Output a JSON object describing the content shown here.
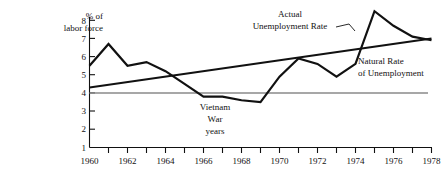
{
  "chart_data": {
    "type": "line",
    "title": "",
    "xlabel": "",
    "ylabel": "% of labor force",
    "ylabel_line1": "% of",
    "ylabel_line2": "labor force",
    "xlim": [
      1960,
      1978
    ],
    "ylim": [
      1,
      8
    ],
    "ytick_labels": [
      "1",
      "2",
      "3",
      "4",
      "5",
      "6",
      "7",
      "8"
    ],
    "ytick_values": [
      1,
      2,
      3,
      4,
      5,
      6,
      7,
      8
    ],
    "xtick_values": [
      1960,
      1961,
      1962,
      1963,
      1964,
      1965,
      1966,
      1967,
      1968,
      1969,
      1970,
      1971,
      1972,
      1973,
      1974,
      1975,
      1976,
      1977,
      1978
    ],
    "xtick_labels_shown": [
      "1960",
      "1962",
      "1964",
      "1966",
      "1968",
      "1970",
      "1972",
      "1974",
      "1976",
      "1978"
    ],
    "grid": false,
    "legend_position": "inline-annotations",
    "series": [
      {
        "name": "Actual Unemployment Rate",
        "color": "#111111",
        "x": [
          1960,
          1961,
          1962,
          1963,
          1964,
          1965,
          1966,
          1967,
          1968,
          1969,
          1970,
          1971,
          1972,
          1973,
          1974,
          1975,
          1976,
          1977,
          1978
        ],
        "values": [
          5.5,
          6.7,
          5.5,
          5.7,
          5.2,
          4.5,
          3.8,
          3.8,
          3.6,
          3.5,
          4.9,
          5.9,
          5.6,
          4.9,
          5.6,
          8.5,
          7.7,
          7.1,
          6.9
        ]
      },
      {
        "name": "Natural Rate of Unemployment",
        "color": "#111111",
        "x": [
          1960,
          1978
        ],
        "values": [
          4.3,
          7.0
        ]
      }
    ],
    "reference_lines": [
      {
        "name": "four-percent-line",
        "value": 4,
        "color": "#8a8a8a"
      }
    ],
    "annotations": [
      {
        "name": "actual-rate-label",
        "line1": "Actual",
        "line2": "Unemployment Rate"
      },
      {
        "name": "natural-rate-label",
        "line1": "Natural Rate",
        "line2": "of Unemployment"
      },
      {
        "name": "vietnam-label",
        "line1": "Vietnam",
        "line2": "War",
        "line3": "years"
      }
    ]
  }
}
